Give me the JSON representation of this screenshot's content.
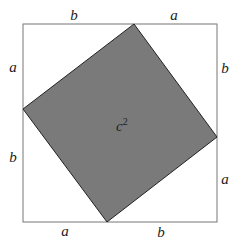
{
  "diagram": {
    "colors": {
      "fill": "#7a7a7a",
      "outer_stroke": "#777777",
      "inner_stroke": "#222222"
    },
    "labels": {
      "top_left": "b",
      "top_right": "a",
      "left_top": "a",
      "left_bottom": "b",
      "right_top": "b",
      "right_bottom": "a",
      "bottom_left": "a",
      "bottom_right": "b",
      "center": "c",
      "center_exp": "2"
    }
  }
}
